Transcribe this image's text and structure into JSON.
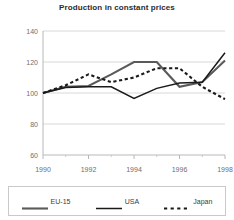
{
  "chart_data": {
    "type": "line",
    "title": "Production in constant prices",
    "xlabel": "",
    "ylabel": "",
    "xlim": [
      1990,
      1998
    ],
    "ylim": [
      60,
      140
    ],
    "yticks": [
      60,
      80,
      100,
      120,
      140
    ],
    "xticks": [
      1990,
      1992,
      1994,
      1996,
      1998
    ],
    "xminorticks": [
      1991,
      1993,
      1995,
      1997
    ],
    "grid": "horizontal",
    "legend_position": "bottom",
    "x": [
      1990,
      1991,
      1992,
      1993,
      1994,
      1995,
      1996,
      1997,
      1998
    ],
    "series": [
      {
        "name": "EU-15",
        "color": "#5a5a5a",
        "style": "solid",
        "values": [
          100,
          104,
          104.5,
          112,
          120,
          120,
          104,
          107,
          121
        ]
      },
      {
        "name": "USA",
        "color": "#1a1a1a",
        "style": "solid",
        "values": [
          100,
          103.5,
          104,
          104,
          96.5,
          103,
          106.5,
          107,
          126
        ]
      },
      {
        "name": "Japan",
        "color": "#1a1a1a",
        "style": "dashed",
        "values": [
          100,
          105,
          112,
          107,
          110,
          116,
          116,
          104,
          96
        ]
      }
    ]
  },
  "legend": {
    "entries": [
      {
        "label": "EU-15"
      },
      {
        "label": "USA"
      },
      {
        "label": "Japan"
      }
    ]
  },
  "axis": {
    "y_labels": [
      "140",
      "120",
      "100",
      "80",
      "60"
    ],
    "x_labels": [
      "1990",
      "1992",
      "1994",
      "1996",
      "1998"
    ]
  }
}
